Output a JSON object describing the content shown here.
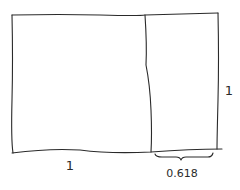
{
  "diagram": {
    "type": "golden-rectangle-sketch",
    "shapes": {
      "outer_rectangle": {
        "description": "hand-drawn rectangle"
      },
      "square": {
        "description": "left square region, side 1"
      },
      "small_rectangle": {
        "description": "right rectangle region, width 0.618"
      }
    },
    "labels": {
      "bottom_square_width": "1",
      "right_height": "1",
      "brace_width": "0.618"
    },
    "colors": {
      "ink": "#2a2a2a",
      "background": "#ffffff"
    }
  }
}
